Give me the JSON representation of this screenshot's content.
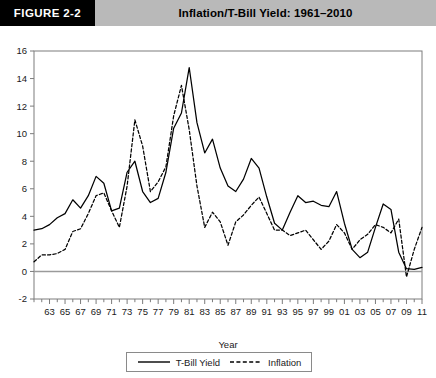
{
  "header": {
    "badge": "FIGURE 2-2",
    "title": "Inflation/T-Bill Yield: 1961–2010"
  },
  "axes": {
    "xlabel": "Year",
    "ylabel": "",
    "y_ticks": [
      "16",
      "14",
      "12",
      "10",
      "8",
      "6",
      "4",
      "2",
      "0",
      "-2"
    ],
    "x_ticks": [
      "63",
      "65",
      "67",
      "69",
      "71",
      "73",
      "75",
      "77",
      "79",
      "81",
      "83",
      "85",
      "87",
      "89",
      "91",
      "93",
      "95",
      "97",
      "99",
      "01",
      "03",
      "05",
      "07",
      "09",
      "11"
    ]
  },
  "legend": {
    "position": "bottom-center",
    "entries": [
      {
        "label": "T-Bill Yield",
        "style": "solid",
        "color": "#000000",
        "icon": "solid-line-swatch"
      },
      {
        "label": "Inflation",
        "style": "dashed",
        "color": "#000000",
        "icon": "dashed-line-swatch"
      }
    ]
  },
  "chart_data": {
    "type": "line",
    "title": "Inflation/T-Bill Yield: 1961–2010",
    "xlabel": "Year",
    "ylabel": "",
    "xlim": [
      1961,
      2011
    ],
    "ylim": [
      -2,
      16
    ],
    "yticks": [
      -2,
      0,
      2,
      4,
      6,
      8,
      10,
      12,
      14,
      16
    ],
    "grid": false,
    "zero_line": true,
    "x": [
      1961,
      1962,
      1963,
      1964,
      1965,
      1966,
      1967,
      1968,
      1969,
      1970,
      1971,
      1972,
      1973,
      1974,
      1975,
      1976,
      1977,
      1978,
      1979,
      1980,
      1981,
      1982,
      1983,
      1984,
      1985,
      1986,
      1987,
      1988,
      1989,
      1990,
      1991,
      1992,
      1993,
      1994,
      1995,
      1996,
      1997,
      1998,
      1999,
      2000,
      2001,
      2002,
      2003,
      2004,
      2005,
      2006,
      2007,
      2008,
      2009,
      2010,
      2011
    ],
    "series": [
      {
        "name": "T-Bill Yield",
        "style": "solid",
        "color": "#000000",
        "values": [
          3.0,
          3.1,
          3.4,
          3.9,
          4.2,
          5.2,
          4.6,
          5.5,
          6.9,
          6.4,
          4.4,
          4.6,
          7.2,
          8.0,
          5.8,
          5.0,
          5.3,
          7.2,
          10.4,
          11.5,
          14.8,
          10.8,
          8.6,
          9.6,
          7.5,
          6.2,
          5.8,
          6.7,
          8.2,
          7.5,
          5.4,
          3.5,
          3.0,
          4.3,
          5.5,
          5.0,
          5.1,
          4.8,
          4.7,
          5.8,
          3.5,
          1.6,
          1.0,
          1.4,
          3.2,
          4.9,
          4.5,
          1.4,
          0.2,
          0.15,
          0.3
        ]
      },
      {
        "name": "Inflation",
        "style": "dashed",
        "color": "#000000",
        "values": [
          0.7,
          1.2,
          1.2,
          1.3,
          1.6,
          2.9,
          3.1,
          4.2,
          5.5,
          5.7,
          4.4,
          3.2,
          6.2,
          11.0,
          9.1,
          5.8,
          6.5,
          7.6,
          11.3,
          13.5,
          10.3,
          6.2,
          3.2,
          4.3,
          3.6,
          1.9,
          3.6,
          4.1,
          4.8,
          5.4,
          4.2,
          3.0,
          3.0,
          2.6,
          2.8,
          3.0,
          2.3,
          1.6,
          2.2,
          3.4,
          2.8,
          1.6,
          2.3,
          2.7,
          3.4,
          3.2,
          2.8,
          3.8,
          -0.4,
          1.6,
          3.2
        ]
      }
    ]
  }
}
